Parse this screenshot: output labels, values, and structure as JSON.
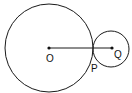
{
  "diagram": {
    "type": "geometry-tangent-circles",
    "circles": [
      {
        "name": "large-circle",
        "center_label": "O",
        "cx": 49,
        "cy": 48,
        "r": 44
      },
      {
        "name": "small-circle",
        "center_label": "Q",
        "cx": 111,
        "cy": 49,
        "r": 18
      }
    ],
    "segment": {
      "from": "O",
      "to": "Q"
    },
    "labels": {
      "O": "O",
      "P": "P",
      "Q": "Q"
    },
    "stroke_color": "#1a1a1a"
  }
}
